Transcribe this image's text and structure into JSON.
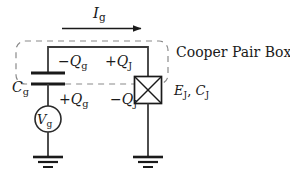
{
  "figure": {
    "name": "Cooper Pair Box circuit schematic",
    "background_color": "#ffffff",
    "ink_color": "#1a1a1a",
    "dashed_color": "#777777"
  },
  "labels": {
    "current": {
      "symbol": "I",
      "sub": "g",
      "full": "Ig"
    },
    "gate_charge_negative": {
      "sign": "−",
      "symbol": "Q",
      "sub": "g",
      "full": "−Qg"
    },
    "junction_charge_positive": {
      "sign": "+",
      "symbol": "Q",
      "sub": "J",
      "full": "+QJ"
    },
    "gate_capacitor": {
      "symbol": "C",
      "sub": "g",
      "full": "Cg"
    },
    "gate_charge_positive": {
      "sign": "+",
      "symbol": "Q",
      "sub": "g",
      "full": "+Qg"
    },
    "junction_charge_negative": {
      "sign": "−",
      "symbol": "Q",
      "sub": "J",
      "full": "−QJ"
    },
    "gate_voltage": {
      "symbol": "V",
      "sub": "g",
      "full": "Vg"
    },
    "box_name": "Cooper Pair Box",
    "junction_params": {
      "energy": "E",
      "energy_sub": "J",
      "separator": ", ",
      "capacitance": "C",
      "capacitance_sub": "J",
      "full": "EJ, CJ"
    }
  },
  "elements": {
    "current_arrow": {
      "name": "current-arrow",
      "direction": "right",
      "x_start": 62,
      "x_end": 141,
      "y": 28
    },
    "dashed_box": {
      "name": "cooper-pair-box-boundary",
      "x": 16,
      "y": 41,
      "width": 152,
      "height": 43,
      "corner_radius": 9,
      "dash": "6 5"
    },
    "gate_capacitor_symbol": {
      "name": "gate-capacitor",
      "plate_y_top": 73,
      "plate_y_bottom": 84,
      "plate_half_width": 17,
      "center_x": 48
    },
    "voltage_source_symbol": {
      "name": "voltage-source",
      "center_x": 48,
      "center_y": 119,
      "radius": 13
    },
    "josephson_junction_symbol": {
      "name": "josephson-junction",
      "x": 134,
      "y": 76,
      "size": 27
    },
    "ground_left": {
      "name": "ground-left",
      "center_x": 48,
      "top_y": 155
    },
    "ground_right": {
      "name": "ground-right",
      "center_x": 148,
      "top_y": 155
    },
    "top_wire": {
      "name": "top-wire",
      "x_start": 48,
      "x_end": 148,
      "y": 47
    }
  }
}
